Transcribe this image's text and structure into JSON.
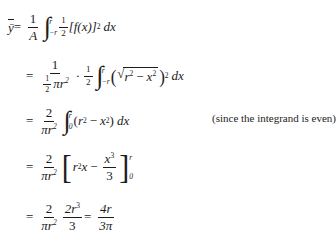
{
  "document": {
    "type": "math-derivation",
    "background_color": "#ffffff",
    "text_color": "#1c1c1c",
    "lines": [
      {
        "id": "line-1",
        "lhs": "ȳ",
        "relation": "=",
        "description": "definition of y-bar as one over A times the integral from minus r to r of one half times f of x squared dx",
        "coefficient_numerator": "1",
        "coefficient_denominator": "A",
        "integral_lower": "−r",
        "integral_upper": "r",
        "inner_fraction_numerator": "1",
        "inner_fraction_denominator": "2",
        "integrand": "[f(x)]",
        "integrand_exponent": "2",
        "differential": "dx"
      },
      {
        "id": "line-2",
        "relation": "=",
        "description": "substituting A equals one half pi r squared and f of x equals square root of r squared minus x squared",
        "coefficient_numerator": "1",
        "coefficient_denominator_frac_num": "1",
        "coefficient_denominator_frac_den": "2",
        "coefficient_denominator_rest": "πr",
        "coefficient_denominator_exponent": "2",
        "dot_operator": "·",
        "half_numerator": "1",
        "half_denominator": "2",
        "integral_lower": "−r",
        "integral_upper": "r",
        "radicand_base": "r",
        "radicand_base_exp": "2",
        "radicand_minus": "−",
        "radicand_var": "x",
        "radicand_var_exp": "2",
        "outer_exponent": "2",
        "differential": "dx"
      },
      {
        "id": "line-3",
        "relation": "=",
        "description": "two over pi r squared times the integral from 0 to r of r squared minus x squared dx",
        "coefficient_numerator": "2",
        "coefficient_denominator": "πr",
        "coefficient_denominator_exponent": "2",
        "integral_lower": "0",
        "integral_upper": "r",
        "integrand_first": "r",
        "integrand_first_exp": "2",
        "integrand_minus": "−",
        "integrand_second": "x",
        "integrand_second_exp": "2",
        "differential": "dx",
        "annotation": "(since the integrand is even)"
      },
      {
        "id": "line-4",
        "relation": "=",
        "description": "two over pi r squared times the bracket r squared x minus x cubed over three evaluated from 0 to r",
        "coefficient_numerator": "2",
        "coefficient_denominator": "πr",
        "coefficient_denominator_exponent": "2",
        "term_one_base": "r",
        "term_one_exp": "2",
        "term_one_var": "x",
        "minus": "−",
        "term_two_numerator": "x",
        "term_two_numerator_exp": "3",
        "term_two_denominator": "3",
        "eval_upper": "r",
        "eval_lower": "0"
      },
      {
        "id": "line-5",
        "relation_first": "=",
        "relation_second": "=",
        "description": "two over pi r squared times two r cubed over three equals four r over three pi",
        "first_numerator": "2",
        "first_denominator": "πr",
        "first_denominator_exponent": "2",
        "second_numerator": "2r",
        "second_numerator_exp": "3",
        "second_denominator": "3",
        "result_numerator": "4r",
        "result_denominator": "3π"
      }
    ],
    "annotation_text": "(since the integrand is even)"
  }
}
